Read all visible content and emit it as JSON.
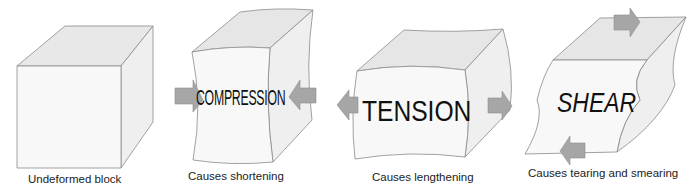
{
  "diagram": {
    "colors": {
      "face_front": "#f7f7f7",
      "face_top": "#e6e6e6",
      "face_side": "#efefef",
      "edge": "#8a8a8a",
      "arrow": "#a6a6a6",
      "arrow_edge": "#8f8f8f",
      "text": "#111111"
    },
    "panels": [
      {
        "id": "undeformed",
        "label": "",
        "caption": "Undeformed block"
      },
      {
        "id": "compression",
        "label": "COMPRESSION",
        "caption": "Causes shortening",
        "arrows": [
          "right-pointing on left side",
          "left-pointing on right side"
        ]
      },
      {
        "id": "tension",
        "label": "TENSION",
        "caption": "Causes lengthening",
        "arrows": [
          "left-pointing on left side",
          "right-pointing on right side"
        ]
      },
      {
        "id": "shear",
        "label": "SHEAR",
        "caption": "Causes tearing and smearing",
        "arrows": [
          "right-pointing on top",
          "left-pointing on bottom"
        ]
      }
    ]
  }
}
